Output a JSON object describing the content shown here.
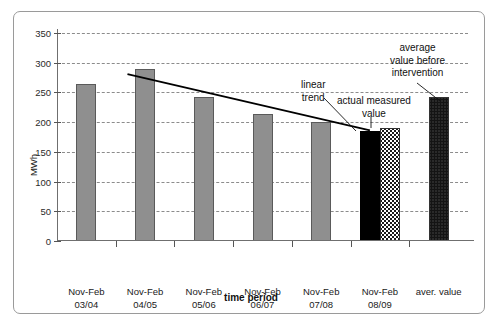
{
  "chart_data": {
    "type": "bar",
    "title": "",
    "xlabel": "time period",
    "ylabel": "MWh",
    "ylim": [
      0,
      350
    ],
    "yticks": [
      0,
      50,
      100,
      150,
      200,
      250,
      300,
      350
    ],
    "grid": true,
    "legend": "none",
    "categories": [
      "Nov-Feb\n03/04",
      "Nov-Feb\n04/05",
      "Nov-Feb\n05/06",
      "Nov-Feb\n06/07",
      "Nov-Feb\n07/08",
      "Nov-Feb\n08/09",
      "aver. value"
    ],
    "category_labels": [
      {
        "line1": "Nov-Feb",
        "line2": "03/04"
      },
      {
        "line1": "Nov-Feb",
        "line2": "04/05"
      },
      {
        "line1": "Nov-Feb",
        "line2": "05/06"
      },
      {
        "line1": "Nov-Feb",
        "line2": "06/07"
      },
      {
        "line1": "Nov-Feb",
        "line2": "07/08"
      },
      {
        "line1": "Nov-Feb",
        "line2": "08/09"
      },
      {
        "line1": "aver. value",
        "line2": ""
      }
    ],
    "bars": [
      {
        "category": "Nov-Feb 03/04",
        "value": 264,
        "style": "solid-gray"
      },
      {
        "category": "Nov-Feb 04/05",
        "value": 290,
        "style": "solid-gray"
      },
      {
        "category": "Nov-Feb 05/06",
        "value": 242,
        "style": "solid-gray"
      },
      {
        "category": "Nov-Feb 06/07",
        "value": 214,
        "style": "solid-gray"
      },
      {
        "category": "Nov-Feb 07/08",
        "value": 201,
        "style": "solid-gray"
      },
      {
        "category": "Nov-Feb 08/09",
        "value": 185,
        "style": "solid-black"
      },
      {
        "category": "Nov-Feb 08/09",
        "value": 191,
        "style": "dot-light"
      },
      {
        "category": "aver. value",
        "value": 242,
        "style": "dot-dark"
      }
    ],
    "trend_line": {
      "label": "linear trend",
      "start": {
        "x_category": "Nov-Feb 04/05",
        "value": 281
      },
      "end": {
        "x_category": "Nov-Feb 08/09",
        "value": 186
      }
    },
    "annotations": [
      {
        "id": "linear-trend",
        "line1": "linear",
        "line2": "trend",
        "target": "trend-line"
      },
      {
        "id": "actual-measured-value",
        "line1": "actual measured",
        "line2": "value",
        "target": "bar-08-09-black"
      },
      {
        "id": "average-value-before-intervention",
        "line1": "average",
        "line2": "value before",
        "line3": "intervention",
        "target": "bar-aver-value"
      }
    ],
    "colors": {
      "bar_gray": "#8f8f8f",
      "bar_black": "#000000",
      "bar_dot_light": "#ffffff",
      "bar_dot_dark": "#6d6d6d",
      "grid": "#8c8c8c",
      "axis": "#6f6f6f",
      "frame": "#9a9a9a",
      "background": "#ffffff"
    }
  }
}
